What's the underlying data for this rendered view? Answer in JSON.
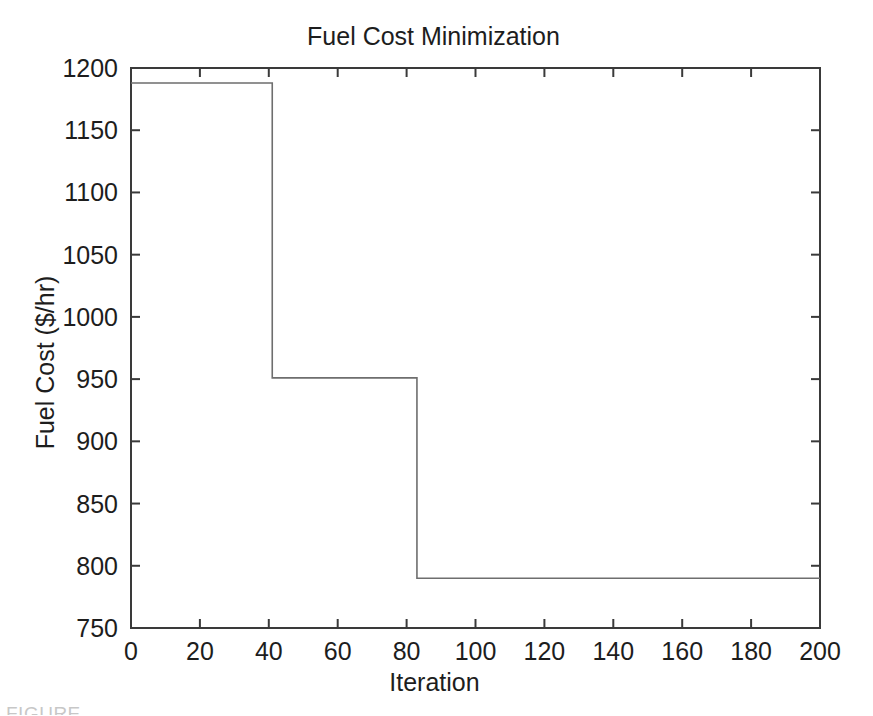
{
  "figure": {
    "title": "Fuel Cost Minimization",
    "caption_fragment": "FIGURE",
    "background_color": "#ffffff",
    "line_color": "#6e6e6e",
    "axis_color": "#3a3a3a"
  },
  "chart_data": {
    "type": "line",
    "title": "Fuel Cost Minimization",
    "xlabel": "Iteration",
    "ylabel": "Fuel Cost ($/hr)",
    "xlim": [
      0,
      200
    ],
    "ylim": [
      750,
      1200
    ],
    "xticks": [
      0,
      20,
      40,
      60,
      80,
      100,
      120,
      140,
      160,
      180,
      200
    ],
    "yticks": [
      750,
      800,
      850,
      900,
      950,
      1000,
      1050,
      1100,
      1150,
      1200
    ],
    "xtick_labels": [
      "0",
      "20",
      "40",
      "60",
      "80",
      "100",
      "120",
      "140",
      "160",
      "180",
      "200"
    ],
    "ytick_labels": [
      "750",
      "800",
      "850",
      "900",
      "950",
      "1000",
      "1050",
      "1100",
      "1150",
      "1200"
    ],
    "grid": false,
    "legend": null,
    "drawstyle": "steps-post",
    "series": [
      {
        "name": "Best Fuel Cost",
        "x": [
          0,
          41,
          41,
          83,
          83,
          200
        ],
        "y": [
          1188,
          1188,
          951,
          951,
          790,
          790
        ]
      }
    ],
    "step_levels": [
      {
        "from_iteration": 0,
        "to_iteration": 41,
        "value": 1188
      },
      {
        "from_iteration": 41,
        "to_iteration": 83,
        "value": 951
      },
      {
        "from_iteration": 83,
        "to_iteration": 200,
        "value": 790
      }
    ],
    "annotations": []
  }
}
